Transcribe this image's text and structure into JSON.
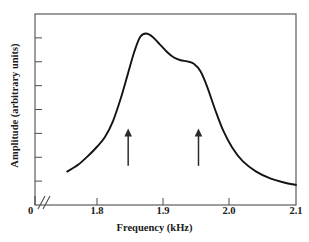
{
  "chart_data": {
    "type": "line",
    "title": "",
    "xlabel": "Frequency (kHz)",
    "ylabel": "Amplitude (arbitrary units)",
    "xlim": [
      1.7,
      2.1
    ],
    "ylim": [
      0,
      1
    ],
    "grid": false,
    "legend": null,
    "axis_break": {
      "present": true,
      "origin_label": "0",
      "note": "double-slash break between 0 and start of frequency scale"
    },
    "x_ticks": [
      {
        "value": 1.8,
        "label": "1.8",
        "px": 97
      },
      {
        "value": 1.9,
        "label": "1.9",
        "px": 163
      },
      {
        "value": 2.0,
        "label": "2.0",
        "px": 229
      },
      {
        "value": 2.1,
        "label": "2.1",
        "px": 296
      }
    ],
    "y_ticks_unlabeled_count": 7,
    "series": [
      {
        "name": "Amplitude response",
        "x": [
          1.755,
          1.772,
          1.788,
          1.8,
          1.812,
          1.824,
          1.836,
          1.846,
          1.856,
          1.865,
          1.874,
          1.884,
          1.895,
          1.906,
          1.916,
          1.926,
          1.936,
          1.946,
          1.956,
          1.966,
          1.978,
          1.99,
          2.004,
          2.02,
          2.04,
          2.062,
          2.082,
          2.1
        ],
        "y": [
          0.175,
          0.212,
          0.262,
          0.305,
          0.356,
          0.438,
          0.56,
          0.68,
          0.8,
          0.88,
          0.898,
          0.88,
          0.84,
          0.8,
          0.772,
          0.758,
          0.752,
          0.74,
          0.7,
          0.62,
          0.5,
          0.392,
          0.3,
          0.228,
          0.175,
          0.138,
          0.118,
          0.105
        ]
      }
    ],
    "annotations": [
      {
        "type": "arrow",
        "direction": "up",
        "x": 1.847,
        "y_tail": 0.205,
        "y_head": 0.4,
        "label": ""
      },
      {
        "type": "arrow",
        "direction": "up",
        "x": 1.953,
        "y_tail": 0.205,
        "y_head": 0.4,
        "label": ""
      }
    ],
    "colors": {
      "curve": "#141414",
      "frame": "#4d4d4d",
      "text": "#1a1a1a",
      "background": "#ffffff",
      "arrow": "#2b2b2b"
    }
  }
}
